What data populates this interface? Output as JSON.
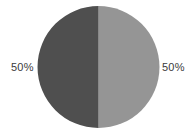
{
  "chart_data": {
    "type": "pie",
    "title": "",
    "subtitle": "",
    "xlabel": "",
    "ylabel": "",
    "grid": false,
    "legend": "none",
    "center": {
      "x": 98.5,
      "y": 67
    },
    "radius": 61,
    "start_angle_deg": 90,
    "direction": "counterclockwise",
    "categories": [
      "Slice 1",
      "Slice 2"
    ],
    "values": [
      50,
      50
    ],
    "labels": [
      "50%",
      "50%"
    ],
    "colors": [
      "#4f4f4f",
      "#959595"
    ],
    "slices": [
      {
        "name": "Slice 1",
        "value": 50,
        "label": "50%",
        "color": "#4f4f4f",
        "position": "left",
        "label_x": 22,
        "label_y": 67
      },
      {
        "name": "Slice 2",
        "value": 50,
        "label": "50%",
        "color": "#959595",
        "position": "right",
        "label_x": 173,
        "label_y": 67
      }
    ]
  },
  "figure": {
    "background_color": "#ffffff",
    "label_text_color": "#3b3b3b",
    "divider_color": "#6e6e6e",
    "width": 195,
    "height": 133
  },
  "labels": {
    "left": "50%",
    "right": "50%"
  }
}
